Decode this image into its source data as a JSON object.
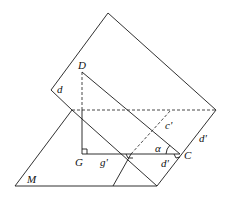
{
  "figure": {
    "labels": {
      "D": "D",
      "d": "d",
      "G": "G",
      "g_prime": "g'",
      "c_prime": "c'",
      "alpha": "α",
      "C": "C",
      "d_prime_right": "d'",
      "d_prime_bottom": "d'",
      "M": "M"
    },
    "line_color": "#1a1a1a",
    "background": "#ffffff"
  }
}
